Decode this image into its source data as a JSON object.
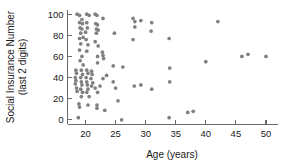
{
  "chart_data": {
    "type": "scatter",
    "title": "",
    "xlabel": "Age (years)",
    "ylabel_line1": "Social Insurance Number",
    "ylabel_line2": "(last 2 digits)",
    "xlim": [
      17,
      52
    ],
    "ylim": [
      -4,
      104
    ],
    "xticks": [
      20,
      25,
      30,
      35,
      40,
      45,
      50
    ],
    "yticks": [
      0,
      20,
      40,
      60,
      80,
      100
    ],
    "grid": false,
    "legend": "none",
    "marker_color": "#808080",
    "marker_size": 3,
    "points": [
      [
        18.6,
        100
      ],
      [
        19.0,
        99
      ],
      [
        19.4,
        95
      ],
      [
        20.2,
        100
      ],
      [
        20.6,
        99
      ],
      [
        21.6,
        100
      ],
      [
        21.9,
        99
      ],
      [
        22.9,
        96
      ],
      [
        19.0,
        92
      ],
      [
        19.5,
        91
      ],
      [
        20.2,
        92
      ],
      [
        21.7,
        91
      ],
      [
        22.0,
        90
      ],
      [
        19.1,
        87
      ],
      [
        19.4,
        86
      ],
      [
        20.3,
        87
      ],
      [
        21.8,
        86
      ],
      [
        22.1,
        85
      ],
      [
        19.2,
        82
      ],
      [
        20.0,
        83
      ],
      [
        21.8,
        82
      ],
      [
        24.8,
        82
      ],
      [
        19.0,
        77
      ],
      [
        19.6,
        78
      ],
      [
        20.1,
        76
      ],
      [
        21.6,
        74
      ],
      [
        19.2,
        72
      ],
      [
        20.4,
        71
      ],
      [
        22.1,
        70
      ],
      [
        19.0,
        66
      ],
      [
        20.2,
        65
      ],
      [
        22.8,
        64
      ],
      [
        19.4,
        60
      ],
      [
        22.0,
        60
      ],
      [
        22.9,
        61
      ],
      [
        23.0,
        58
      ],
      [
        19.1,
        56
      ],
      [
        22.0,
        54
      ],
      [
        19.6,
        52
      ],
      [
        24.6,
        51
      ],
      [
        26.2,
        50
      ],
      [
        18.4,
        47
      ],
      [
        19.3,
        47
      ],
      [
        20.2,
        47
      ],
      [
        21.0,
        46
      ],
      [
        18.5,
        44
      ],
      [
        19.5,
        43
      ],
      [
        20.4,
        44
      ],
      [
        21.1,
        43
      ],
      [
        23.5,
        42
      ],
      [
        18.3,
        40
      ],
      [
        19.2,
        40
      ],
      [
        20.1,
        40
      ],
      [
        20.9,
        39
      ],
      [
        22.9,
        39
      ],
      [
        18.4,
        37
      ],
      [
        19.3,
        36
      ],
      [
        20.2,
        36
      ],
      [
        21.2,
        35
      ],
      [
        24.6,
        36
      ],
      [
        18.3,
        34
      ],
      [
        19.4,
        33
      ],
      [
        20.3,
        33
      ],
      [
        21.0,
        32
      ],
      [
        22.4,
        32
      ],
      [
        18.5,
        30
      ],
      [
        19.2,
        29
      ],
      [
        20.4,
        29
      ],
      [
        21.6,
        30
      ],
      [
        25.0,
        30
      ],
      [
        18.6,
        27
      ],
      [
        19.5,
        26
      ],
      [
        20.2,
        26
      ],
      [
        22.0,
        26
      ],
      [
        19.3,
        22
      ],
      [
        20.6,
        22
      ],
      [
        25.4,
        18
      ],
      [
        18.9,
        15
      ],
      [
        20.4,
        14
      ],
      [
        21.9,
        14
      ],
      [
        19.0,
        12
      ],
      [
        21.9,
        11
      ],
      [
        23.2,
        9
      ],
      [
        18.8,
        2
      ],
      [
        26.0,
        0
      ],
      [
        27.9,
        96
      ],
      [
        28.2,
        93
      ],
      [
        29.2,
        94
      ],
      [
        31.0,
        92
      ],
      [
        28.2,
        88
      ],
      [
        30.9,
        84
      ],
      [
        27.9,
        76
      ],
      [
        33.9,
        77
      ],
      [
        34.0,
        49
      ],
      [
        28.1,
        32
      ],
      [
        29.2,
        33
      ],
      [
        31.0,
        29
      ],
      [
        34.0,
        36
      ],
      [
        33.9,
        2
      ],
      [
        37.0,
        7
      ],
      [
        37.9,
        8
      ],
      [
        40.0,
        55
      ],
      [
        42.0,
        93
      ],
      [
        46.0,
        60
      ],
      [
        47.0,
        62
      ],
      [
        50.0,
        60
      ]
    ]
  }
}
